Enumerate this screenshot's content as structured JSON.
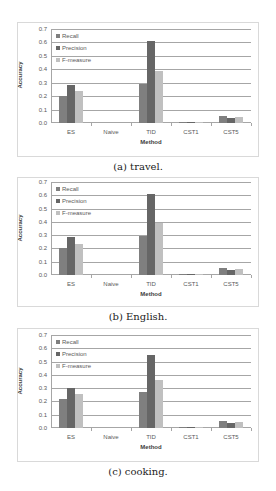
{
  "colors": {
    "recall": "#7f7f7f",
    "precision": "#666666",
    "fmeasure": "#c0c0c0"
  },
  "chart_data": [
    {
      "type": "bar",
      "title": "",
      "caption": "(a) travel.",
      "xlabel": "Method",
      "ylabel": "Accuracy",
      "ylim": [
        0,
        0.7
      ],
      "yticks": [
        "0.0",
        "0.1",
        "0.2",
        "0.3",
        "0.4",
        "0.5",
        "0.6",
        "0.7"
      ],
      "grid": true,
      "legend_position": "upper-left",
      "categories": [
        "ES",
        "Naive",
        "TID",
        "CST1",
        "CST5"
      ],
      "series": [
        {
          "name": "Recall",
          "values": [
            0.2,
            0.0,
            0.29,
            0.005,
            0.05
          ]
        },
        {
          "name": "Precision",
          "values": [
            0.285,
            0.0,
            0.61,
            0.005,
            0.04
          ]
        },
        {
          "name": "F-measure",
          "values": [
            0.235,
            0.0,
            0.39,
            0.005,
            0.045
          ]
        }
      ]
    },
    {
      "type": "bar",
      "title": "",
      "caption": "(b) English.",
      "xlabel": "Method",
      "ylabel": "Accuracy",
      "ylim": [
        0,
        0.7
      ],
      "yticks": [
        "0.0",
        "0.1",
        "0.2",
        "0.3",
        "0.4",
        "0.5",
        "0.6",
        "0.7"
      ],
      "grid": true,
      "legend_position": "upper-left",
      "categories": [
        "ES",
        "Naive",
        "TID",
        "CST1",
        "CST5"
      ],
      "series": [
        {
          "name": "Recall",
          "values": [
            0.2,
            0.0,
            0.29,
            0.005,
            0.05
          ]
        },
        {
          "name": "Precision",
          "values": [
            0.285,
            0.0,
            0.61,
            0.005,
            0.04
          ]
        },
        {
          "name": "F-measure",
          "values": [
            0.235,
            0.0,
            0.39,
            0.005,
            0.045
          ]
        }
      ]
    },
    {
      "type": "bar",
      "title": "",
      "caption": "(c) cooking.",
      "xlabel": "Method",
      "ylabel": "Accuracy",
      "ylim": [
        0,
        0.7
      ],
      "yticks": [
        "0.0",
        "0.1",
        "0.2",
        "0.3",
        "0.4",
        "0.5",
        "0.6",
        "0.7"
      ],
      "grid": true,
      "legend_position": "upper-left",
      "categories": [
        "ES",
        "Naive",
        "TID",
        "CST1",
        "CST5"
      ],
      "series": [
        {
          "name": "Recall",
          "values": [
            0.22,
            0.0,
            0.27,
            0.005,
            0.05
          ]
        },
        {
          "name": "Precision",
          "values": [
            0.3,
            0.0,
            0.55,
            0.005,
            0.04
          ]
        },
        {
          "name": "F-measure",
          "values": [
            0.255,
            0.0,
            0.36,
            0.005,
            0.045
          ]
        }
      ]
    }
  ]
}
